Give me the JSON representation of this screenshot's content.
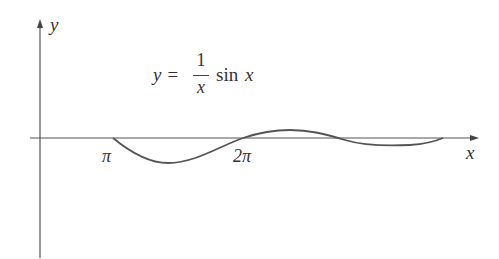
{
  "figure": {
    "axis_x_label": "x",
    "axis_y_label": "y",
    "equation": {
      "lhs": "y =",
      "numerator": "1",
      "denominator": "x",
      "rhs_fn": "sin",
      "rhs_var": "x"
    },
    "ticks": [
      {
        "label": "π",
        "value": "pi"
      },
      {
        "label": "2π",
        "value": "2pi"
      }
    ],
    "curve_color": "#555555",
    "axis_color": "#555555"
  }
}
